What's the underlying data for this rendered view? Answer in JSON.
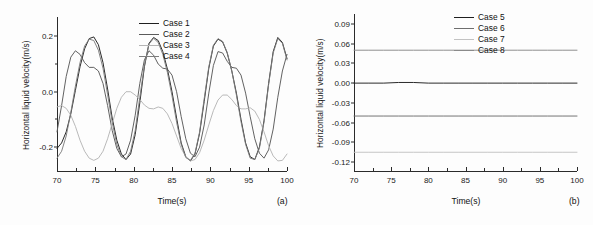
{
  "figure": {
    "background": "#fdfdfd",
    "axis_color": "#2b2b2b",
    "text_color": "#111111"
  },
  "chart_data": [
    {
      "type": "line",
      "panel": "(a)",
      "title": "",
      "xlabel": "Time(s)",
      "ylabel": "Horizontal liquid velocity(m/s)",
      "xlim": [
        70,
        100
      ],
      "ylim": [
        -0.29,
        0.27
      ],
      "xticks": [
        70,
        75,
        80,
        85,
        90,
        95,
        100
      ],
      "xticklabels": [
        "70",
        "75",
        "80",
        "85",
        "90",
        "95",
        "100"
      ],
      "yticks": [
        -0.2,
        0.0,
        0.2
      ],
      "yticklabels": [
        "-0.2",
        "0.0",
        "0.2"
      ],
      "yminor": [
        -0.1,
        0.1
      ],
      "grid": false,
      "legend_position": "top-center",
      "series": [
        {
          "name": "Case 1",
          "color": "#1f1f1f",
          "x": [
            70,
            70.6,
            71.2,
            71.8,
            72.4,
            73,
            73.6,
            74.2,
            74.8,
            75.4,
            76,
            76.6,
            77.2,
            77.8,
            78.4,
            79,
            79.6,
            80.2,
            80.8,
            81.4,
            82,
            82.6,
            83.2,
            83.8,
            84.4,
            85,
            85.6,
            86.2,
            86.8,
            87.4,
            88,
            88.6,
            89.2,
            89.8,
            90.4,
            91,
            91.6,
            92.2,
            92.8,
            93.4,
            94,
            94.6,
            95.2,
            95.8,
            96.4,
            97,
            97.6,
            98.2,
            98.8,
            99.4,
            100
          ],
          "y": [
            -0.205,
            -0.185,
            -0.145,
            -0.08,
            0.005,
            0.09,
            0.155,
            0.192,
            0.198,
            0.17,
            0.105,
            0.01,
            -0.095,
            -0.175,
            -0.225,
            -0.245,
            -0.225,
            -0.155,
            -0.04,
            0.09,
            0.175,
            0.196,
            0.185,
            0.145,
            0.082,
            0.0,
            -0.095,
            -0.185,
            -0.235,
            -0.25,
            -0.225,
            -0.15,
            -0.035,
            0.085,
            0.165,
            0.19,
            0.18,
            0.14,
            0.075,
            -0.005,
            -0.1,
            -0.185,
            -0.235,
            -0.245,
            -0.2,
            -0.105,
            0.03,
            0.145,
            0.196,
            0.178,
            0.12
          ]
        },
        {
          "name": "Case 2",
          "color": "#5a5a5a",
          "x": [
            70,
            70.6,
            71.2,
            71.8,
            72.4,
            73,
            73.6,
            74.2,
            74.8,
            75.4,
            76,
            76.6,
            77.2,
            77.8,
            78.4,
            79,
            79.6,
            80.2,
            80.8,
            81.4,
            82,
            82.6,
            83.2,
            83.8,
            84.4,
            85,
            85.6,
            86.2,
            86.8,
            87.4,
            88,
            88.6,
            89.2,
            89.8,
            90.4,
            91,
            91.6,
            92.2,
            92.8,
            93.4,
            94,
            94.6,
            95.2,
            95.8,
            96.4,
            97,
            97.6,
            98.2,
            98.8,
            99.4,
            100
          ],
          "y": [
            -0.145,
            -0.05,
            0.055,
            0.125,
            0.148,
            0.135,
            0.105,
            0.088,
            0.088,
            0.075,
            0.03,
            -0.05,
            -0.14,
            -0.205,
            -0.235,
            -0.225,
            -0.175,
            -0.085,
            0.03,
            0.115,
            0.148,
            0.132,
            0.1,
            0.085,
            0.082,
            0.06,
            0.0,
            -0.09,
            -0.17,
            -0.222,
            -0.235,
            -0.2,
            -0.12,
            -0.005,
            0.095,
            0.145,
            0.14,
            0.11,
            0.088,
            0.085,
            0.06,
            -0.005,
            -0.09,
            -0.17,
            -0.222,
            -0.24,
            -0.21,
            -0.135,
            -0.02,
            0.075,
            0.135
          ]
        },
        {
          "name": "Case 3",
          "color": "#b5b5b5",
          "x": [
            70,
            70.6,
            71.2,
            71.8,
            72.4,
            73,
            73.6,
            74.2,
            74.8,
            75.4,
            76,
            76.6,
            77.2,
            77.8,
            78.4,
            79,
            79.6,
            80.2,
            80.8,
            81.4,
            82,
            82.6,
            83.2,
            83.8,
            84.4,
            85,
            85.6,
            86.2,
            86.8,
            87.4,
            88,
            88.6,
            89.2,
            89.8,
            90.4,
            91,
            91.6,
            92.2,
            92.8,
            93.4,
            94,
            94.6,
            95.2,
            95.8,
            96.4,
            97,
            97.6,
            98.2,
            98.8,
            99.4,
            100
          ],
          "y": [
            -0.055,
            -0.05,
            -0.06,
            -0.085,
            -0.125,
            -0.175,
            -0.215,
            -0.24,
            -0.248,
            -0.24,
            -0.215,
            -0.17,
            -0.115,
            -0.06,
            -0.02,
            0.0,
            0.0,
            -0.012,
            -0.028,
            -0.048,
            -0.06,
            -0.062,
            -0.055,
            -0.06,
            -0.08,
            -0.115,
            -0.16,
            -0.205,
            -0.235,
            -0.25,
            -0.245,
            -0.22,
            -0.175,
            -0.12,
            -0.068,
            -0.03,
            -0.012,
            -0.012,
            -0.028,
            -0.05,
            -0.062,
            -0.062,
            -0.058,
            -0.07,
            -0.1,
            -0.145,
            -0.195,
            -0.232,
            -0.25,
            -0.248,
            -0.225
          ]
        },
        {
          "name": "Case 4",
          "color": "#7d7d7d",
          "x": [
            70,
            70.6,
            71.2,
            71.8,
            72.4,
            73,
            73.6,
            74.2,
            74.8,
            75.4,
            76,
            76.6,
            77.2,
            77.8,
            78.4,
            79,
            79.6,
            80.2,
            80.8,
            81.4,
            82,
            82.6,
            83.2,
            83.8,
            84.4,
            85,
            85.6,
            86.2,
            86.8,
            87.4,
            88,
            88.6,
            89.2,
            89.8,
            90.4,
            91,
            91.6,
            92.2,
            92.8,
            93.4,
            94,
            94.6,
            95.2,
            95.8,
            96.4,
            97,
            97.6,
            98.2,
            98.8,
            99.4,
            100
          ],
          "y": [
            -0.24,
            -0.215,
            -0.16,
            -0.075,
            0.02,
            0.105,
            0.165,
            0.19,
            0.185,
            0.15,
            0.085,
            -0.01,
            -0.11,
            -0.19,
            -0.235,
            -0.245,
            -0.215,
            -0.14,
            -0.02,
            0.095,
            0.172,
            0.193,
            0.178,
            0.135,
            0.07,
            -0.015,
            -0.11,
            -0.19,
            -0.238,
            -0.248,
            -0.222,
            -0.145,
            -0.025,
            0.09,
            0.168,
            0.192,
            0.182,
            0.142,
            0.075,
            -0.012,
            -0.108,
            -0.19,
            -0.24,
            -0.245,
            -0.205,
            -0.11,
            0.025,
            0.14,
            0.192,
            0.175,
            0.115
          ]
        }
      ]
    },
    {
      "type": "line",
      "panel": "(b)",
      "title": "",
      "xlabel": "Time(s)",
      "ylabel": "Horizontal liquid velocity(m/s)",
      "xlim": [
        70,
        100
      ],
      "ylim": [
        -0.135,
        0.105
      ],
      "xticks": [
        70,
        75,
        80,
        85,
        90,
        95,
        100
      ],
      "xticklabels": [
        "70",
        "75",
        "80",
        "85",
        "90",
        "95",
        "100"
      ],
      "yticks": [
        0.09,
        0.06,
        0.03,
        0.0,
        -0.03,
        -0.06,
        -0.09,
        -0.12
      ],
      "yticklabels": [
        "0.09",
        "0.06",
        "0.03",
        "0.00",
        "-0.03",
        "-0.06",
        "-0.09",
        "-0.12"
      ],
      "grid": false,
      "legend_position": "top-center",
      "series": [
        {
          "name": "Case 5",
          "color": "#1f1f1f",
          "x": [
            70,
            72,
            74,
            76,
            78,
            80,
            82,
            84,
            86,
            88,
            90,
            92,
            94,
            96,
            98,
            100
          ],
          "y": [
            0.0,
            0.0,
            0.0,
            0.001,
            0.001,
            0.0,
            0.0,
            0.0,
            0.0,
            0.0,
            0.0,
            0.0,
            0.0,
            0.0,
            0.0,
            0.0
          ]
        },
        {
          "name": "Case 6",
          "color": "#6e6e6e",
          "x": [
            70,
            72,
            74,
            76,
            78,
            80,
            82,
            84,
            86,
            88,
            90,
            92,
            94,
            96,
            98,
            100
          ],
          "y": [
            -0.05,
            -0.05,
            -0.05,
            -0.05,
            -0.05,
            -0.05,
            -0.05,
            -0.05,
            -0.05,
            -0.05,
            -0.05,
            -0.05,
            -0.05,
            -0.05,
            -0.05,
            -0.05
          ]
        },
        {
          "name": "Case 7",
          "color": "#c2c2c2",
          "x": [
            70,
            72,
            74,
            76,
            78,
            80,
            82,
            84,
            86,
            88,
            90,
            92,
            94,
            96,
            98,
            100
          ],
          "y": [
            -0.105,
            -0.105,
            -0.105,
            -0.105,
            -0.105,
            -0.105,
            -0.105,
            -0.105,
            -0.105,
            -0.105,
            -0.105,
            -0.105,
            -0.105,
            -0.105,
            -0.105,
            -0.105
          ]
        },
        {
          "name": "Case 8",
          "color": "#8a8a8a",
          "x": [
            70,
            72,
            74,
            76,
            78,
            80,
            82,
            84,
            86,
            88,
            90,
            92,
            94,
            96,
            98,
            100
          ],
          "y": [
            0.05,
            0.05,
            0.05,
            0.05,
            0.05,
            0.05,
            0.05,
            0.05,
            0.05,
            0.05,
            0.05,
            0.05,
            0.05,
            0.05,
            0.05,
            0.05
          ]
        }
      ]
    }
  ]
}
